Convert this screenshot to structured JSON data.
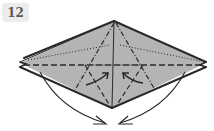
{
  "step": {
    "number": "12"
  },
  "diagram": {
    "type": "origami-fold-diagram",
    "paper_color": "#b4b4b4",
    "line_color": "#2a2a2a",
    "shape": "diamond / kite base with layered flaps",
    "annotations": [
      "valley fold lines (dashed)",
      "mountain fold lines (dot-dash)",
      "reference creases (dotted)",
      "two curved arrows folding side points down to bottom",
      "two small arrows pushing inward at center"
    ]
  }
}
